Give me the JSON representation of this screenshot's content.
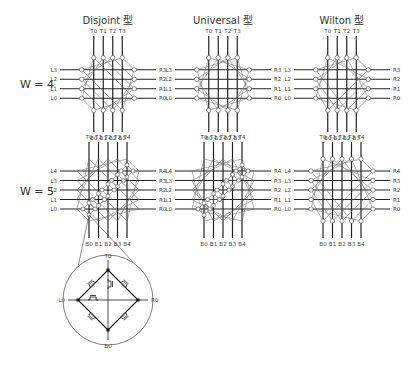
{
  "columns": [
    {
      "title": "Disjoint 型"
    },
    {
      "title": "Universal 型"
    },
    {
      "title": "Wilton 型"
    }
  ],
  "rows": [
    {
      "label": "W = 4",
      "width": 4
    },
    {
      "label": "W = 5",
      "width": 5
    }
  ],
  "pin_labels": {
    "w4": {
      "top": [
        "T0",
        "T1",
        "T2",
        "T3"
      ],
      "bottom": [
        "B0",
        "B1",
        "B2",
        "B3"
      ],
      "left": [
        "L3",
        "L2",
        "L1",
        "L0"
      ],
      "right": [
        "R3",
        "R2",
        "R1",
        "R0"
      ]
    },
    "w5": {
      "top": [
        "T0",
        "T1",
        "T2",
        "T3",
        "T4"
      ],
      "bottom": [
        "B0",
        "B1",
        "B2",
        "B3",
        "B4"
      ],
      "left": [
        "L4",
        "L3",
        "L2",
        "L1",
        "L0"
      ],
      "right": [
        "R4",
        "R3",
        "R2",
        "R1",
        "R0"
      ]
    }
  },
  "detail": {
    "top": "T0",
    "bottom": "B0",
    "left": "L0",
    "right": "R0"
  }
}
